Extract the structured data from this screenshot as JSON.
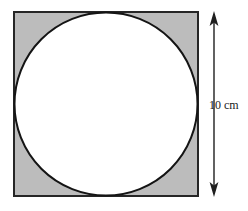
{
  "figure": {
    "square": {
      "name": "shaded-square",
      "fill_color": "#bcbcbc",
      "stroke_color": "#262626",
      "stroke_width": 2,
      "x": 14,
      "y": 12,
      "size": 184,
      "side_length_value": "10",
      "side_length_unit": "cm"
    },
    "circle": {
      "name": "inscribed-circle",
      "fill_color": "#ffffff",
      "stroke_color": "#141414",
      "stroke_width": 2,
      "center_x": 106,
      "center_y": 104,
      "radius": 92,
      "diameter_value": "10",
      "diameter_unit": "cm"
    },
    "dimension": {
      "name": "height-dimension",
      "label": "10 cm",
      "line_color": "#1f1f1f",
      "line_x": 214,
      "line_top": 12,
      "line_bottom": 196,
      "arrow_top": "up",
      "arrow_bottom": "down"
    },
    "background_color": "#ffffff"
  }
}
